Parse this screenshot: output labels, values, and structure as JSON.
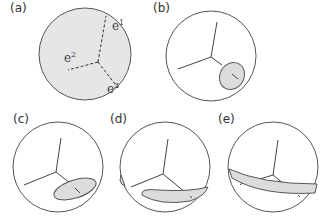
{
  "figure": {
    "panels": [
      {
        "id": "a",
        "label": "(a)",
        "description": "shaded sphere with dashed axes e1, e2, e3"
      },
      {
        "id": "b",
        "label": "(b)",
        "description": "sphere with small elliptical patch around e3 axis"
      },
      {
        "id": "c",
        "label": "(c)",
        "description": "sphere with elongated elliptical patch"
      },
      {
        "id": "d",
        "label": "(d)",
        "description": "sphere with curved band wrapping around"
      },
      {
        "id": "e",
        "label": "(e)",
        "description": "sphere with full equatorial band"
      }
    ],
    "axis_labels": {
      "e1": {
        "base": "e",
        "sup": "1"
      },
      "e2": {
        "base": "e",
        "sup": "2"
      },
      "e3": {
        "base": "e",
        "sup": "3"
      }
    },
    "colors": {
      "stroke": "#555555",
      "fill_shaded": "#e6e6e6",
      "fill_patch": "#dcdcdc",
      "background": "#ffffff"
    }
  }
}
